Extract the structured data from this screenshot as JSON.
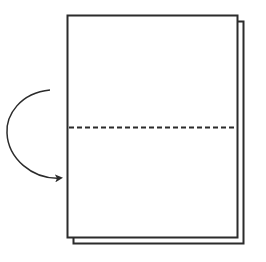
{
  "diagram": {
    "type": "paper-folding-instruction",
    "colors": {
      "background": "#ffffff",
      "stroke": "#2b2b2b"
    },
    "sheets": [
      {
        "name": "back-sheet",
        "x": 73,
        "y": 21,
        "width": 171,
        "height": 223
      },
      {
        "name": "front-sheet",
        "x": 67,
        "y": 15,
        "width": 171,
        "height": 223
      }
    ],
    "fold_line": {
      "style": "dashed",
      "y": 127,
      "x1": 68,
      "x2": 237
    },
    "fold_arrow": {
      "direction": "top-half-folds-down",
      "start": [
        50,
        90
      ],
      "end": [
        62,
        178
      ]
    }
  }
}
